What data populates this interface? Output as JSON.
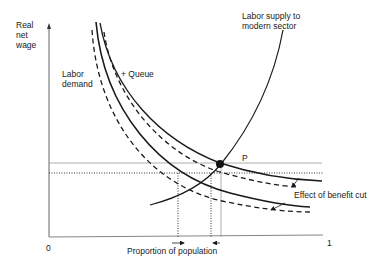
{
  "diagram": {
    "axes": {
      "y_label": "Real\nnet\nwage",
      "x_label": "Proportion of population",
      "x_origin": "0",
      "x_end": "1"
    },
    "labels": {
      "labor_demand": "Labor\ndemand",
      "queue": "+ Queue",
      "labor_supply": "Labor supply to\nmodern sector",
      "equilibrium_point": "P",
      "effect": "Effect of benefit cut"
    },
    "curves": [
      {
        "name": "Labor demand",
        "style": "solid"
      },
      {
        "name": "Labor demand + Queue",
        "style": "solid"
      },
      {
        "name": "Labor demand (after benefit cut)",
        "style": "dashed"
      },
      {
        "name": "Labor demand + Queue (after benefit cut)",
        "style": "dashed"
      },
      {
        "name": "Labor supply to modern sector",
        "style": "solid"
      }
    ],
    "reference_lines": {
      "horizontal": [
        "wage at P (solid gray)",
        "wage after benefit cut (dotted)"
      ],
      "vertical": [
        "dotted",
        "dotted",
        "solid gray at P"
      ]
    },
    "arrows": {
      "bottom_left": "→",
      "bottom_right": "←"
    },
    "colors": {
      "line": "#1a1a1a",
      "reference": "#9a9a9a",
      "background": "#ffffff"
    }
  }
}
